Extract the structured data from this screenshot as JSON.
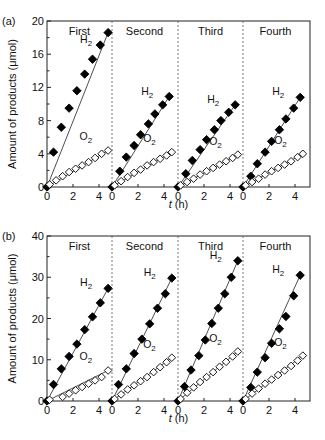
{
  "figure": {
    "ylabel": "Amount of products (μmol)",
    "xlabel_italic": "t",
    "xlabel_unit": " (h)",
    "runs": [
      "First",
      "Second",
      "Third",
      "Fourth"
    ],
    "series_labels": {
      "h2_main": "H",
      "h2_sub": "2",
      "o2_main": "O",
      "o2_sub": "2"
    },
    "colors": {
      "axis": "#222222",
      "h2_marker": "#000000",
      "o2_marker": "#ffffff",
      "divider": "#555555"
    }
  },
  "chart_data": [
    {
      "panel": "(a)",
      "type": "scatter",
      "title": "",
      "xlabel": "t (h)",
      "ylabel": "Amount of products (μmol)",
      "ylim": [
        0,
        20
      ],
      "yticks": [
        0,
        4,
        8,
        12,
        16,
        20
      ],
      "xlim_per_run": [
        0,
        5
      ],
      "xticks_per_run": [
        0,
        2,
        4
      ],
      "grid": false,
      "runs": [
        {
          "name": "First",
          "series": [
            {
              "name": "H2",
              "marker": "filled-diamond",
              "t": [
                0,
                0.5,
                1.1,
                1.7,
                2.3,
                2.9,
                3.5,
                4.1,
                4.7
              ],
              "values": [
                0,
                4.2,
                7.2,
                9.5,
                11.6,
                13.6,
                15.4,
                17.1,
                18.6
              ]
            },
            {
              "name": "O2",
              "marker": "open-diamond",
              "t": [
                0.2,
                0.7,
                1.2,
                1.7,
                2.2,
                2.7,
                3.2,
                3.7,
                4.2,
                4.7
              ],
              "values": [
                0.3,
                0.8,
                1.3,
                1.8,
                2.2,
                2.6,
                3.0,
                3.5,
                4.0,
                4.4
              ]
            }
          ]
        },
        {
          "name": "Second",
          "series": [
            {
              "name": "H2",
              "marker": "filled-diamond",
              "t": [
                0,
                0.6,
                1.1,
                1.7,
                2.2,
                2.8,
                3.3,
                3.9,
                4.4
              ],
              "values": [
                0,
                1.9,
                3.6,
                5.0,
                6.3,
                7.6,
                8.8,
                9.9,
                10.9
              ]
            },
            {
              "name": "O2",
              "marker": "open-diamond",
              "t": [
                0.2,
                0.7,
                1.2,
                1.7,
                2.2,
                2.7,
                3.2,
                3.7,
                4.2,
                4.6
              ],
              "values": [
                0.2,
                0.7,
                1.2,
                1.7,
                2.1,
                2.6,
                3.0,
                3.4,
                3.8,
                4.2
              ]
            }
          ]
        },
        {
          "name": "Third",
          "series": [
            {
              "name": "H2",
              "marker": "filled-diamond",
              "t": [
                0,
                0.6,
                1.1,
                1.7,
                2.2,
                2.8,
                3.3,
                3.9,
                4.4
              ],
              "values": [
                0,
                1.6,
                3.2,
                4.5,
                5.7,
                6.9,
                8.0,
                9.0,
                9.9
              ]
            },
            {
              "name": "O2",
              "marker": "open-diamond",
              "t": [
                0.2,
                0.7,
                1.2,
                1.7,
                2.2,
                2.7,
                3.2,
                3.7,
                4.2,
                4.6
              ],
              "values": [
                0.2,
                0.6,
                1.0,
                1.5,
                1.9,
                2.3,
                2.7,
                3.1,
                3.5,
                3.9
              ]
            }
          ]
        },
        {
          "name": "Fourth",
          "series": [
            {
              "name": "H2",
              "marker": "filled-diamond",
              "t": [
                0,
                0.6,
                1.1,
                1.7,
                2.2,
                2.8,
                3.3,
                3.9,
                4.4
              ],
              "values": [
                0,
                1.3,
                2.8,
                4.2,
                5.5,
                6.9,
                8.2,
                9.5,
                10.8
              ]
            },
            {
              "name": "O2",
              "marker": "open-diamond",
              "t": [
                0.2,
                0.7,
                1.2,
                1.7,
                2.2,
                2.7,
                3.2,
                3.7,
                4.2,
                4.6
              ],
              "values": [
                0.2,
                0.6,
                1.0,
                1.5,
                1.9,
                2.3,
                2.7,
                3.1,
                3.6,
                4.0
              ]
            }
          ]
        }
      ]
    },
    {
      "panel": "(b)",
      "type": "scatter",
      "title": "",
      "xlabel": "t (h)",
      "ylabel": "Amount of products (μmol)",
      "ylim": [
        0,
        40
      ],
      "yticks": [
        0,
        10,
        20,
        30,
        40
      ],
      "xlim_per_run": [
        0,
        5
      ],
      "xticks_per_run": [
        0,
        2,
        4
      ],
      "grid": false,
      "runs": [
        {
          "name": "First",
          "series": [
            {
              "name": "H2",
              "marker": "filled-diamond",
              "t": [
                0,
                0.5,
                1.1,
                1.7,
                2.3,
                2.9,
                3.5,
                4.1,
                4.7
              ],
              "values": [
                0,
                4.0,
                7.8,
                10.8,
                13.8,
                17.3,
                20.4,
                23.8,
                27.3
              ]
            },
            {
              "name": "O2",
              "marker": "open-diamond",
              "t": [
                0.2,
                1.2,
                1.7,
                2.2,
                2.7,
                3.2,
                3.7,
                4.2,
                4.7
              ],
              "values": [
                0.3,
                1.0,
                1.8,
                2.6,
                3.4,
                4.2,
                5.0,
                5.8,
                7.4
              ]
            }
          ]
        },
        {
          "name": "Second",
          "series": [
            {
              "name": "H2",
              "marker": "filled-diamond",
              "t": [
                0,
                0.5,
                1.1,
                1.7,
                2.3,
                2.9,
                3.5,
                4.1,
                4.6
              ],
              "values": [
                0,
                4.0,
                7.8,
                11.5,
                15.0,
                18.7,
                22.5,
                26.0,
                29.8
              ]
            },
            {
              "name": "O2",
              "marker": "open-diamond",
              "t": [
                0.2,
                0.7,
                1.2,
                1.7,
                2.2,
                2.7,
                3.2,
                3.7,
                4.2,
                4.6
              ],
              "values": [
                0.5,
                1.6,
                2.8,
                3.8,
                4.8,
                5.8,
                7.0,
                8.2,
                9.4,
                10.5
              ]
            }
          ]
        },
        {
          "name": "Third",
          "series": [
            {
              "name": "H2",
              "marker": "filled-diamond",
              "t": [
                0,
                0.5,
                1.0,
                1.6,
                2.1,
                2.6,
                3.1,
                3.6,
                4.1,
                4.6
              ],
              "values": [
                0,
                3.5,
                7.5,
                11.0,
                14.8,
                18.8,
                22.5,
                26.0,
                30.0,
                34.0
              ]
            },
            {
              "name": "O2",
              "marker": "open-diamond",
              "t": [
                0.2,
                0.7,
                1.2,
                1.7,
                2.2,
                2.7,
                3.2,
                3.7,
                4.2,
                4.6
              ],
              "values": [
                0.5,
                2.0,
                3.3,
                4.6,
                5.8,
                7.0,
                8.3,
                9.5,
                10.8,
                12.0
              ]
            }
          ]
        },
        {
          "name": "Fourth",
          "series": [
            {
              "name": "H2",
              "marker": "filled-diamond",
              "t": [
                0,
                0.6,
                1.1,
                1.7,
                2.2,
                2.8,
                3.3,
                3.9,
                4.4
              ],
              "values": [
                0,
                3.3,
                7.0,
                10.5,
                14.0,
                17.5,
                20.5,
                25.5,
                30.5
              ]
            },
            {
              "name": "O2",
              "marker": "open-diamond",
              "t": [
                0.2,
                0.7,
                1.2,
                1.7,
                2.2,
                2.7,
                3.2,
                3.7,
                4.2,
                4.6
              ],
              "values": [
                0.5,
                1.8,
                3.0,
                4.2,
                5.2,
                6.3,
                7.4,
                8.5,
                9.8,
                11.0
              ]
            }
          ]
        }
      ]
    }
  ]
}
